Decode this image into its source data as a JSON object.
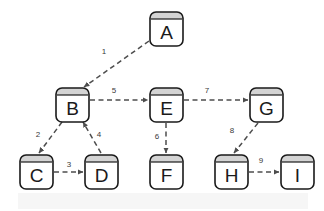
{
  "diagram": {
    "type": "node-link-diagram",
    "background_color": "#ffffff",
    "tint_color": "#f6f6f6",
    "node_fill": "#ffffff",
    "node_header_fill": "#d4d4d4",
    "node_stroke": "#1a1a1a",
    "edge_color": "#4d4d4d",
    "label_color": "#3a3a3a",
    "nodes": [
      {
        "id": "A",
        "label": "A",
        "x": 150,
        "y": 12,
        "w": 33,
        "h": 34
      },
      {
        "id": "B",
        "label": "B",
        "x": 56,
        "y": 88,
        "w": 33,
        "h": 34
      },
      {
        "id": "E",
        "label": "E",
        "x": 150,
        "y": 88,
        "w": 33,
        "h": 34
      },
      {
        "id": "G",
        "label": "G",
        "x": 250,
        "y": 88,
        "w": 33,
        "h": 34
      },
      {
        "id": "C",
        "label": "C",
        "x": 20,
        "y": 155,
        "w": 33,
        "h": 34
      },
      {
        "id": "D",
        "label": "D",
        "x": 85,
        "y": 155,
        "w": 33,
        "h": 34
      },
      {
        "id": "F",
        "label": "F",
        "x": 150,
        "y": 155,
        "w": 33,
        "h": 34
      },
      {
        "id": "H",
        "label": "H",
        "x": 215,
        "y": 155,
        "w": 33,
        "h": 34
      },
      {
        "id": "I",
        "label": "I",
        "x": 281,
        "y": 155,
        "w": 33,
        "h": 34
      }
    ],
    "edges": [
      {
        "id": "e1",
        "label": "1",
        "from": "A",
        "to": "B",
        "x1": 149,
        "y1": 41,
        "x2": 84,
        "y2": 87,
        "lx": 104,
        "ly": 52
      },
      {
        "id": "e2",
        "label": "2",
        "from": "B",
        "to": "C",
        "x1": 62,
        "y1": 122,
        "x2": 39,
        "y2": 153,
        "lx": 38,
        "ly": 135
      },
      {
        "id": "e3",
        "label": "3",
        "from": "C",
        "to": "D",
        "x1": 54,
        "y1": 172,
        "x2": 83,
        "y2": 172,
        "lx": 69,
        "ly": 165
      },
      {
        "id": "e4",
        "label": "4",
        "from": "D",
        "to": "B",
        "x1": 101,
        "y1": 153,
        "x2": 83,
        "y2": 122,
        "lx": 99,
        "ly": 135
      },
      {
        "id": "e5",
        "label": "5",
        "from": "B",
        "to": "E",
        "x1": 90,
        "y1": 100,
        "x2": 148,
        "y2": 100,
        "lx": 114,
        "ly": 91
      },
      {
        "id": "e6",
        "label": "6",
        "from": "E",
        "to": "F",
        "x1": 166,
        "y1": 123,
        "x2": 166,
        "y2": 153,
        "lx": 157,
        "ly": 137
      },
      {
        "id": "e7",
        "label": "7",
        "from": "E",
        "to": "G",
        "x1": 184,
        "y1": 100,
        "x2": 248,
        "y2": 100,
        "lx": 207,
        "ly": 91
      },
      {
        "id": "e8",
        "label": "8",
        "from": "G",
        "to": "H",
        "x1": 258,
        "y1": 123,
        "x2": 234,
        "y2": 153,
        "lx": 232,
        "ly": 131
      },
      {
        "id": "e9",
        "label": "9",
        "from": "H",
        "to": "I",
        "x1": 249,
        "y1": 172,
        "x2": 279,
        "y2": 172,
        "lx": 261,
        "ly": 161
      }
    ]
  }
}
